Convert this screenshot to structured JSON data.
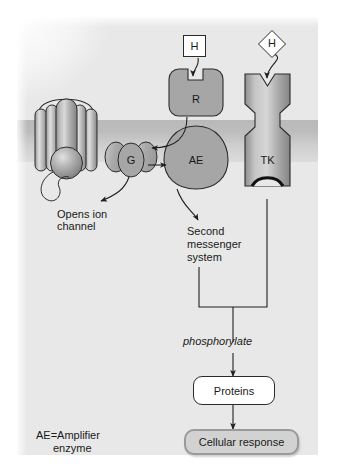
{
  "figure": {
    "background_color": "#e8e8e8",
    "membrane_color": "#bdbdbd",
    "protein_fill": "#a6a6a6",
    "stroke_color": "#2b2b2b"
  },
  "membrane": {
    "name": "plasma membrane band"
  },
  "ion_channel": {
    "label": "",
    "caption_line1": "Opens ion",
    "caption_line2": "channel"
  },
  "gprotein": {
    "label": "G"
  },
  "receptor": {
    "label": "R",
    "ligand_label": "H",
    "ligand_shape": "square"
  },
  "amplifier_enzyme": {
    "label": "AE"
  },
  "tyrosine_kinase": {
    "label": "TK",
    "ligand_label": "H",
    "ligand_shape": "diamond"
  },
  "second_messenger": {
    "line1": "Second",
    "line2": "messenger",
    "line3": "system"
  },
  "phosphorylate": {
    "label": "phosphorylate"
  },
  "proteins_box": {
    "label": "Proteins"
  },
  "cellular_response_box": {
    "label": "Cellular response"
  },
  "legend": {
    "line1": "AE=Amplifier",
    "line2": "enzyme"
  }
}
